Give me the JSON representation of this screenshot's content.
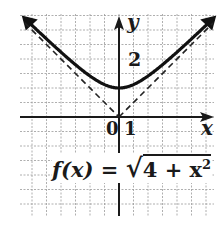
{
  "chart_data": {
    "type": "line",
    "title": "",
    "function": "f(x) = sqrt(4 + x^2)",
    "xlabel": "x",
    "ylabel": "y",
    "xlim": [
      -7,
      6.5
    ],
    "ylim": [
      -7,
      7
    ],
    "grid": true,
    "tick_labels": {
      "origin": "0",
      "x_unit": "1",
      "y_mark": "2"
    },
    "series": [
      {
        "name": "f(x)",
        "style": "solid",
        "x": [
          -6.5,
          -5,
          -4,
          -3,
          -2,
          -1,
          0,
          1,
          2,
          3,
          4,
          5,
          6.5
        ],
        "values": [
          6.8,
          5.39,
          4.47,
          3.61,
          2.83,
          2.24,
          2.0,
          2.24,
          2.83,
          3.61,
          4.47,
          5.39,
          6.8
        ]
      },
      {
        "name": "asymptote y = -x",
        "style": "dashed",
        "x": [
          -6.5,
          0
        ],
        "values": [
          6.5,
          0
        ]
      },
      {
        "name": "asymptote y = x",
        "style": "dashed",
        "x": [
          0,
          6.5
        ],
        "values": [
          0,
          6.5
        ]
      }
    ]
  },
  "labels": {
    "y_axis": "y",
    "x_axis": "x",
    "origin": "0",
    "x_tick": "1",
    "y_tick": "2",
    "equation_lhs": "f(x) = ",
    "equation_radicand": "4 + x",
    "equation_exponent": "2"
  }
}
